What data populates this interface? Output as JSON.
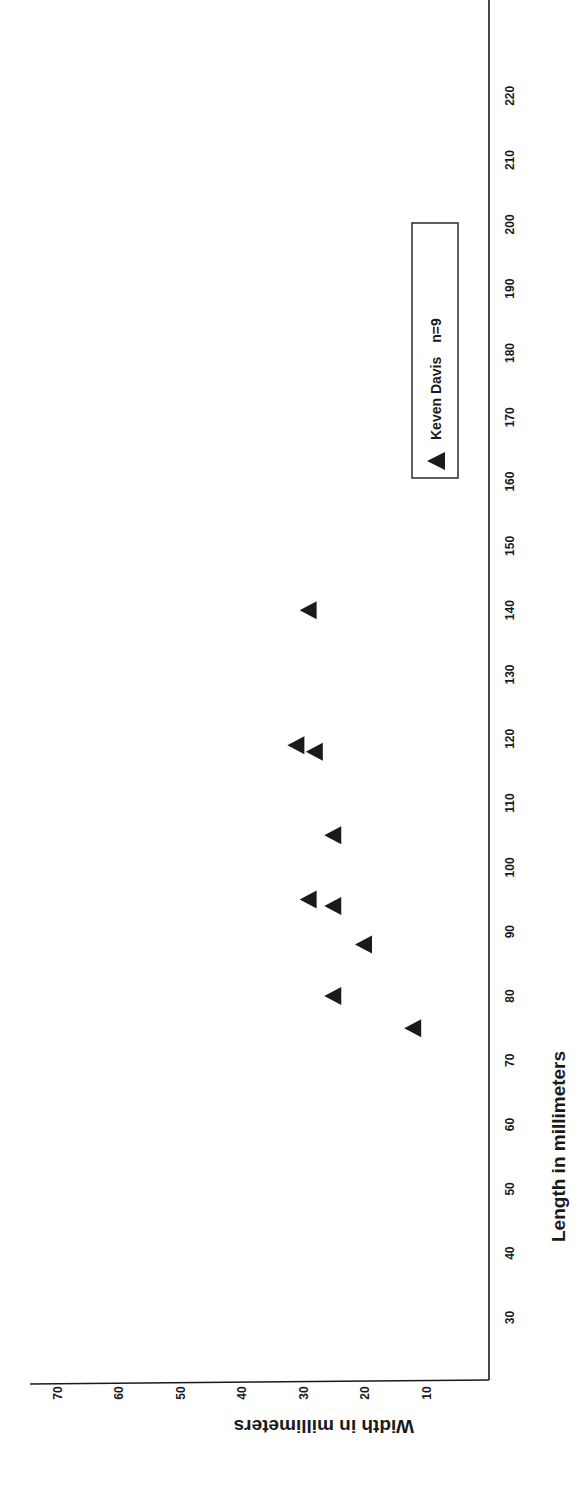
{
  "chart_data": {
    "type": "scatter",
    "title": "",
    "xlabel": "Length in millimeters",
    "ylabel": "Width in millimeters",
    "orientation": "rotated 90 degrees clockwise on page (x-axis vertical on right, y-axis horizontal at bottom)",
    "xlim": [
      20,
      230
    ],
    "ylim": [
      0,
      74
    ],
    "x_ticks": [
      30,
      40,
      50,
      60,
      70,
      80,
      90,
      100,
      110,
      120,
      130,
      140,
      150,
      160,
      170,
      180,
      190,
      200,
      210,
      220
    ],
    "y_ticks": [
      10,
      20,
      30,
      40,
      50,
      60,
      70
    ],
    "grid": false,
    "legend_position": "upper right (inside plot)",
    "series": [
      {
        "name": "Keven Davis  n=9",
        "marker": "triangle",
        "color": "#1a1a1a",
        "points": [
          {
            "x": 75,
            "y": 12
          },
          {
            "x": 80,
            "y": 25
          },
          {
            "x": 88,
            "y": 20
          },
          {
            "x": 94,
            "y": 25
          },
          {
            "x": 95,
            "y": 29
          },
          {
            "x": 105,
            "y": 25
          },
          {
            "x": 118,
            "y": 28
          },
          {
            "x": 119,
            "y": 31
          },
          {
            "x": 140,
            "y": 29
          }
        ]
      }
    ]
  },
  "legend": {
    "label": "Keven Davis",
    "count": "n=9"
  },
  "colors": {
    "ink": "#1a1a1a",
    "background": "#ffffff"
  }
}
